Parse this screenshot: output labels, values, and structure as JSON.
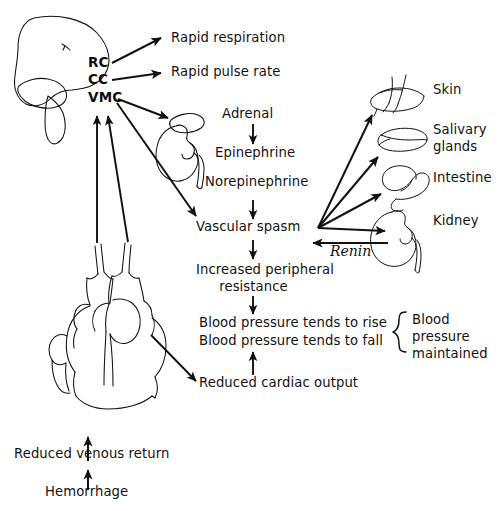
{
  "diagram": {
    "background_color": "#ffffff",
    "ink_color": "#111111",
    "organs": [
      {
        "name": "brain",
        "label": ""
      },
      {
        "name": "adrenal-kidney",
        "label": ""
      },
      {
        "name": "heart",
        "label": ""
      },
      {
        "name": "skin",
        "label": "Skin"
      },
      {
        "name": "salivary-glands",
        "label": "Salivary\nglands"
      },
      {
        "name": "intestine",
        "label": "Intestine"
      },
      {
        "name": "kidney",
        "label": "Kidney"
      }
    ],
    "brain_centers": [
      {
        "code": "RC",
        "name": "respiratory-center"
      },
      {
        "code": "CC",
        "name": "cardiac-center"
      },
      {
        "code": "VMC",
        "name": "vasomotor-center"
      }
    ],
    "outputs": [
      {
        "label": "Rapid respiration"
      },
      {
        "label": "Rapid pulse rate"
      }
    ],
    "adrenal_chain": [
      {
        "label": "Adrenal"
      },
      {
        "label": "Epinephrine"
      },
      {
        "label": "Norepinephrine"
      }
    ],
    "vascular_chain": [
      {
        "label": "Vascular spasm"
      },
      {
        "label": "Increased peripheral\nresistance"
      },
      {
        "label": "Blood pressure tends to rise"
      },
      {
        "label": "Blood pressure tends to fall"
      },
      {
        "label": "Reduced cardiac output"
      }
    ],
    "target_organs": [
      {
        "label": "Skin"
      },
      {
        "label": "Salivary\nglands"
      },
      {
        "label": "Intestine"
      },
      {
        "label": "Kidney"
      }
    ],
    "feedback": {
      "label": "Renin"
    },
    "brace_label": "Blood\npressure\nmaintained",
    "input_chain": [
      {
        "label": "Reduced venous return"
      },
      {
        "label": "Hemorrhage"
      }
    ]
  }
}
